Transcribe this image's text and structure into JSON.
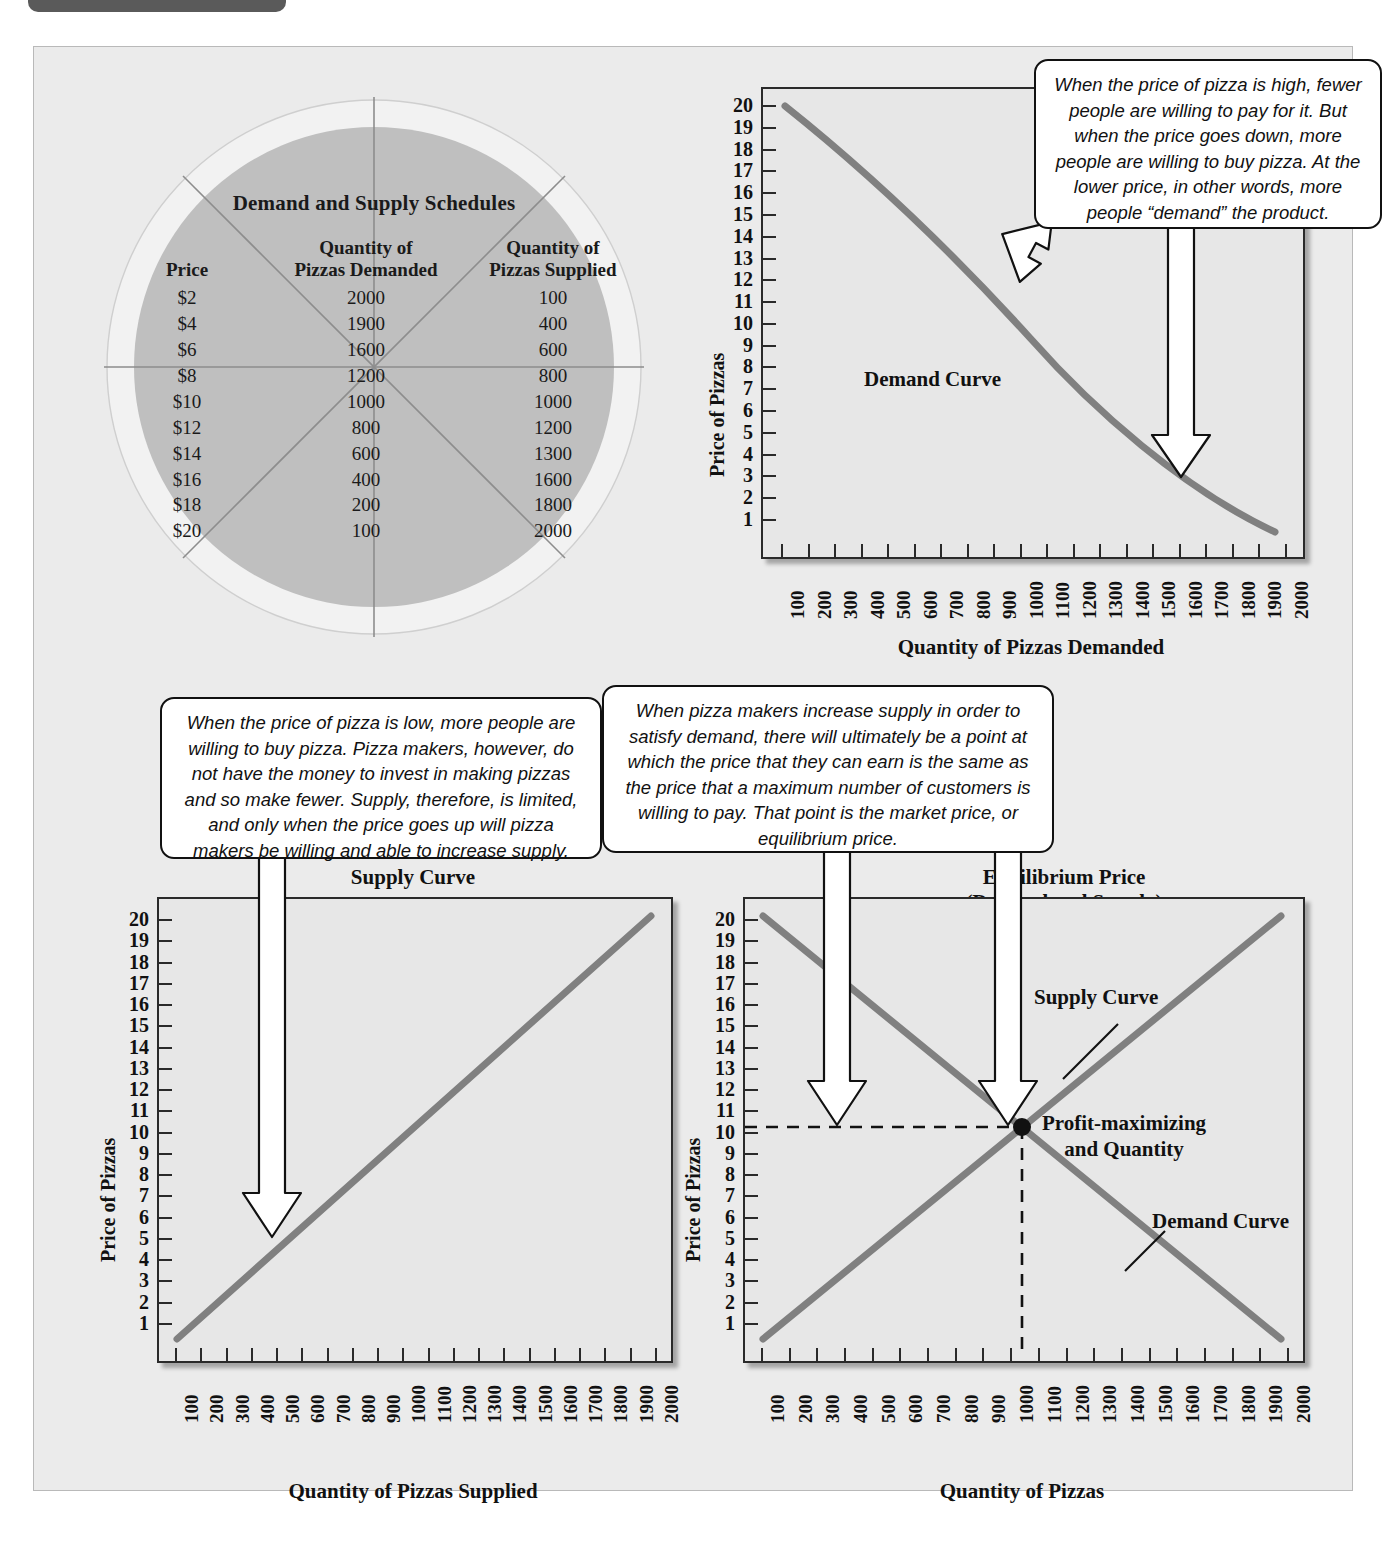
{
  "schedule": {
    "title": "Demand and Supply Schedules",
    "headers": [
      "Price",
      "Quantity of\nPizzas Demanded",
      "Quantity of\nPizzas Supplied"
    ],
    "header_price": "Price",
    "header_demand_l1": "Quantity of",
    "header_demand_l2": "Pizzas Demanded",
    "header_supply_l1": "Quantity of",
    "header_supply_l2": "Pizzas Supplied",
    "rows": [
      {
        "price": "$2",
        "demanded": "2000",
        "supplied": "100"
      },
      {
        "price": "$4",
        "demanded": "1900",
        "supplied": "400"
      },
      {
        "price": "$6",
        "demanded": "1600",
        "supplied": "600"
      },
      {
        "price": "$8",
        "demanded": "1200",
        "supplied": "800"
      },
      {
        "price": "$10",
        "demanded": "1000",
        "supplied": "1000"
      },
      {
        "price": "$12",
        "demanded": "800",
        "supplied": "1200"
      },
      {
        "price": "$14",
        "demanded": "600",
        "supplied": "1300"
      },
      {
        "price": "$16",
        "demanded": "400",
        "supplied": "1600"
      },
      {
        "price": "$18",
        "demanded": "200",
        "supplied": "1800"
      },
      {
        "price": "$20",
        "demanded": "100",
        "supplied": "2000"
      }
    ]
  },
  "callouts": {
    "demand": "When the price of pizza is high, fewer people are willing to pay for it. But when the price goes down, more people are willing to buy pizza. At the lower price, in other words, more people “demand” the product.",
    "supply": "When the price of pizza is low, more people are willing to buy pizza. Pizza makers, however, do not have the money to invest in making pizzas and so make fewer. Supply, therefore, is limited, and only when the price goes up will pizza makers be willing and able to increase supply.",
    "equilibrium": "When pizza makers increase supply in order to satisfy demand, there will ultimately be a point at which the price that they can earn is the same as the price that a maximum number of customers is willing to pay. That point is the market price, or equilibrium price."
  },
  "labels": {
    "price_of_pizzas": "Price of Pizzas",
    "qty_demanded": "Quantity of Pizzas Demanded",
    "qty_supplied": "Quantity of Pizzas Supplied",
    "qty_pizzas": "Quantity of Pizzas",
    "demand_curve": "Demand Curve",
    "supply_curve": "Supply Curve",
    "supply_curve_title": "Supply Curve",
    "equilibrium_title_l1": "Equilibrium Price",
    "equilibrium_title_l2": "(Demand and Supply)",
    "profit_point_l1": "Profit-maximizing",
    "profit_point_l2": "and Quantity"
  },
  "colors": {
    "page_bg": "#ebebeb",
    "plot_bg": "#e7e7e7",
    "curve": "#808080",
    "axis": "#2a2a2a",
    "pizza_cheese": "#bfbfbf",
    "pizza_crust": "#f0f0f0",
    "text": "#111111"
  },
  "axes": {
    "y_ticks": [
      20,
      19,
      18,
      17,
      16,
      15,
      14,
      13,
      12,
      11,
      10,
      9,
      8,
      7,
      6,
      5,
      4,
      3,
      2,
      1
    ],
    "x_ticks": [
      100,
      200,
      300,
      400,
      500,
      600,
      700,
      800,
      900,
      1000,
      1100,
      1200,
      1300,
      1400,
      1500,
      1600,
      1700,
      1800,
      1900,
      2000
    ],
    "ylim": [
      1,
      20
    ],
    "xlim": [
      100,
      2000
    ]
  },
  "chart_data": [
    {
      "type": "line",
      "id": "demand-chart",
      "title": "",
      "xlabel": "Quantity of Pizzas Demanded",
      "ylabel": "Price of Pizzas",
      "xlim": [
        0,
        2000
      ],
      "ylim": [
        1,
        20
      ],
      "grid": false,
      "legend": null,
      "annotations": [
        "Demand Curve"
      ],
      "series": [
        {
          "name": "Demand Curve",
          "x": [
            100,
            200,
            400,
            600,
            800,
            1000,
            1200,
            1600,
            1900,
            2000
          ],
          "y": [
            20,
            18,
            16,
            14,
            12,
            10,
            8,
            6,
            4,
            2
          ]
        }
      ]
    },
    {
      "type": "line",
      "id": "supply-chart",
      "title": "Supply Curve",
      "xlabel": "Quantity of Pizzas Supplied",
      "ylabel": "Price of Pizzas",
      "xlim": [
        0,
        2000
      ],
      "ylim": [
        1,
        20
      ],
      "grid": false,
      "legend": null,
      "annotations": [],
      "series": [
        {
          "name": "Supply Curve",
          "x": [
            100,
            400,
            600,
            800,
            1000,
            1200,
            1300,
            1600,
            1800,
            2000
          ],
          "y": [
            2,
            4,
            6,
            8,
            10,
            12,
            14,
            16,
            18,
            20
          ]
        }
      ]
    },
    {
      "type": "line",
      "id": "equilibrium-chart",
      "title": "Equilibrium Price (Demand and Supply)",
      "xlabel": "Quantity of Pizzas",
      "ylabel": "Price of Pizzas",
      "xlim": [
        0,
        2000
      ],
      "ylim": [
        1,
        20
      ],
      "grid": false,
      "legend": null,
      "annotations": [
        "Supply Curve",
        "Demand Curve",
        "Profit-maximizing and Quantity"
      ],
      "equilibrium_point": {
        "x": 1000,
        "y": 10
      },
      "series": [
        {
          "name": "Supply Curve",
          "x": [
            100,
            1000,
            2000
          ],
          "y": [
            2,
            10,
            20
          ]
        },
        {
          "name": "Demand Curve",
          "x": [
            100,
            1000,
            2000
          ],
          "y": [
            20,
            10,
            2
          ]
        }
      ]
    }
  ]
}
